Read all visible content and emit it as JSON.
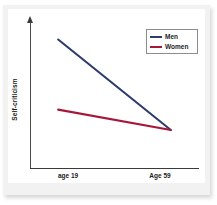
{
  "chart_data": {
    "type": "line",
    "title": "",
    "xlabel": "",
    "ylabel": "Self-criticism",
    "categories": [
      "age 19",
      "Age 59"
    ],
    "x": [
      0,
      1
    ],
    "grid": false,
    "legend_position": "top-right",
    "ylim": [
      0,
      100
    ],
    "xlim": [
      -0.25,
      1.25
    ],
    "y_axis_ticks_shown": false,
    "y_axis_has_arrow": true,
    "series": [
      {
        "name": "Men",
        "color": "#2d3c6b",
        "values": [
          88,
          26
        ]
      },
      {
        "name": "Women",
        "color": "#a6173a",
        "values": [
          40,
          26
        ]
      }
    ],
    "annotations": []
  },
  "legend": {
    "items": [
      {
        "label": "Men",
        "color": "#2d3c6b"
      },
      {
        "label": "Women",
        "color": "#a6173a"
      }
    ]
  },
  "axes": {
    "y_title": "Self-criticism",
    "x_tick_labels": [
      "age 19",
      "Age 59"
    ]
  },
  "colors": {
    "men_line": "#2d3c6b",
    "women_line": "#a6173a",
    "axis": "#3a3a3a",
    "frame": "#f2f2f2",
    "panel": "#ffffff",
    "text": "#1d1d1d",
    "legend_border": "#8c8c8c"
  }
}
